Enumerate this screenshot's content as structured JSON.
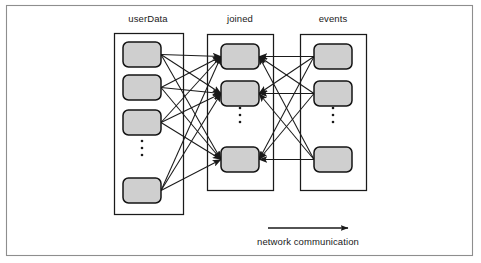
{
  "figure": {
    "title": "",
    "caption": "network communication",
    "frame": {
      "x": 6,
      "y": 5,
      "width": 467,
      "height": 251,
      "stroke": "#8e8e8e"
    }
  },
  "colors": {
    "node_fill": "#cfcfcf",
    "node_stroke": "#141414",
    "group_stroke": "#1a1a1a",
    "frame_stroke": "#8e8e8e",
    "text": "#1a1a1a",
    "background": "#ffffff"
  },
  "columns": [
    {
      "id": "userData",
      "label": "userData",
      "label_x": 148,
      "label_y": 22,
      "container": {
        "x": 114,
        "y": 33,
        "width": 69,
        "height": 181
      },
      "node_count_visible": 4,
      "nodes": [
        {
          "index": 0,
          "x": 123,
          "y": 42,
          "width": 38,
          "height": 25
        },
        {
          "index": 1,
          "x": 123,
          "y": 75,
          "width": 38,
          "height": 25
        },
        {
          "index": 2,
          "x": 123,
          "y": 110,
          "width": 38,
          "height": 25
        },
        {
          "index": 3,
          "x": 123,
          "y": 178,
          "width": 38,
          "height": 25
        }
      ],
      "ellipsis": {
        "x": 142,
        "y": 148,
        "dots": 3,
        "spacing": 7,
        "radius": 1.3
      }
    },
    {
      "id": "joined",
      "label": "joined",
      "label_x": 240,
      "label_y": 22,
      "container": {
        "x": 207,
        "y": 34,
        "width": 66,
        "height": 156
      },
      "node_count_visible": 3,
      "nodes": [
        {
          "index": 0,
          "x": 221,
          "y": 44,
          "width": 38,
          "height": 25
        },
        {
          "index": 1,
          "x": 221,
          "y": 81,
          "width": 38,
          "height": 25
        },
        {
          "index": 2,
          "x": 221,
          "y": 147,
          "width": 38,
          "height": 25
        }
      ],
      "ellipsis": {
        "x": 240,
        "y": 115,
        "dots": 3,
        "spacing": 7,
        "radius": 1.3
      }
    },
    {
      "id": "events",
      "label": "events",
      "label_x": 333,
      "label_y": 22,
      "container": {
        "x": 300,
        "y": 34,
        "width": 66,
        "height": 156
      },
      "node_count_visible": 3,
      "nodes": [
        {
          "index": 0,
          "x": 314,
          "y": 44,
          "width": 38,
          "height": 25
        },
        {
          "index": 1,
          "x": 314,
          "y": 81,
          "width": 38,
          "height": 25
        },
        {
          "index": 2,
          "x": 314,
          "y": 147,
          "width": 38,
          "height": 25
        }
      ],
      "ellipsis": {
        "x": 333,
        "y": 115,
        "dots": 3,
        "spacing": 7,
        "radius": 1.3
      }
    }
  ],
  "edges": {
    "description": "every userData node and every events node sends an arrow into every joined node",
    "left_source_count": 4,
    "right_source_count": 3,
    "target_count": 3,
    "arrowhead": true
  },
  "flow_arrow": {
    "x1": 268,
    "y1": 228,
    "x2": 348,
    "y2": 228,
    "label": "network communication",
    "label_x": 308,
    "label_y": 245
  }
}
